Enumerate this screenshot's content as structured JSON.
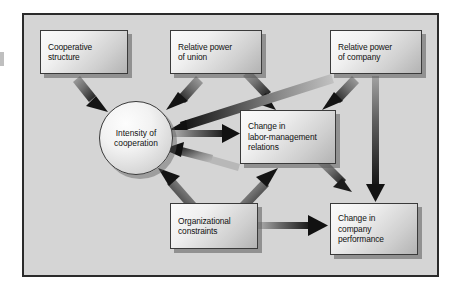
{
  "figure": {
    "type": "flow-diagram",
    "background_color": "#d5d5d5",
    "frame_color": "#2b2b2b",
    "node_fill_light": "#fbfbfb",
    "node_fill_dark": "#b3b3b3",
    "arrow_color": "#1c1c1c"
  },
  "nodes": [
    {
      "id": "cooperative-structure",
      "shape": "rect",
      "lines": [
        "Cooperative",
        "structure"
      ],
      "x": 40,
      "y": 30,
      "w": 88,
      "h": 44
    },
    {
      "id": "relative-power-union",
      "shape": "rect",
      "lines": [
        "Relative power",
        "of union"
      ],
      "x": 170,
      "y": 30,
      "w": 92,
      "h": 44
    },
    {
      "id": "relative-power-company",
      "shape": "rect",
      "lines": [
        "Relative power",
        "of company"
      ],
      "x": 330,
      "y": 30,
      "w": 92,
      "h": 44
    },
    {
      "id": "intensity-of-cooperation",
      "shape": "circle",
      "lines": [
        "Intensity of",
        "cooperation"
      ],
      "x": 99,
      "y": 101,
      "w": 74,
      "h": 74
    },
    {
      "id": "change-labor-management-relations",
      "shape": "rect",
      "lines": [
        "Change in",
        "labor-management",
        "relations"
      ],
      "x": 240,
      "y": 110,
      "w": 96,
      "h": 54
    },
    {
      "id": "organizational-constraints",
      "shape": "rect",
      "lines": [
        "Organizational",
        "constraints"
      ],
      "x": 170,
      "y": 203,
      "w": 88,
      "h": 46
    },
    {
      "id": "change-company-performance",
      "shape": "rect",
      "lines": [
        "Change in",
        "company",
        "performance"
      ],
      "x": 330,
      "y": 203,
      "w": 88,
      "h": 52
    }
  ],
  "edges": [
    {
      "id": "edge-cooperative-structure-to-intensity",
      "from": "cooperative-structure",
      "to": "intensity-of-cooperation"
    },
    {
      "id": "edge-union-to-intensity",
      "from": "relative-power-union",
      "to": "intensity-of-cooperation"
    },
    {
      "id": "edge-union-to-relations",
      "from": "relative-power-union",
      "to": "change-labor-management-relations"
    },
    {
      "id": "edge-company-to-intensity",
      "from": "relative-power-company",
      "to": "intensity-of-cooperation"
    },
    {
      "id": "edge-company-to-relations",
      "from": "relative-power-company",
      "to": "change-labor-management-relations"
    },
    {
      "id": "edge-company-to-performance",
      "from": "relative-power-company",
      "to": "change-company-performance"
    },
    {
      "id": "edge-intensity-to-relations",
      "from": "intensity-of-cooperation",
      "to": "change-labor-management-relations"
    },
    {
      "id": "edge-relations-to-intensity",
      "from": "change-labor-management-relations",
      "to": "intensity-of-cooperation"
    },
    {
      "id": "edge-relations-to-performance",
      "from": "change-labor-management-relations",
      "to": "change-company-performance"
    },
    {
      "id": "edge-constraints-to-intensity",
      "from": "organizational-constraints",
      "to": "intensity-of-cooperation"
    },
    {
      "id": "edge-constraints-to-relations",
      "from": "organizational-constraints",
      "to": "change-labor-management-relations"
    },
    {
      "id": "edge-constraints-to-performance",
      "from": "organizational-constraints",
      "to": "change-company-performance"
    }
  ]
}
